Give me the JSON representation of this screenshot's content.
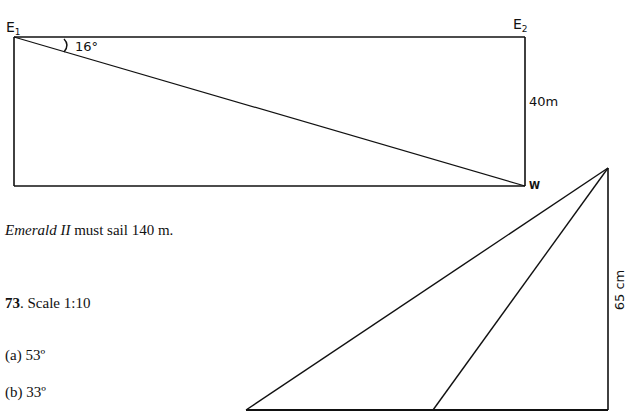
{
  "diagram1": {
    "labels": {
      "e1": "E",
      "e1_sub": "1",
      "e2": "E",
      "e2_sub": "2",
      "w": "W",
      "angle": "16°",
      "side": "40m"
    }
  },
  "text": {
    "answer_italic": "Emerald II",
    "answer_rest": " must sail 140 m.",
    "question_number": "73",
    "question_rest": ". Scale 1:10",
    "part_a": "(a) 53º",
    "part_b": "(b) 33º"
  },
  "diagram2": {
    "labels": {
      "side": "65 cm"
    }
  }
}
